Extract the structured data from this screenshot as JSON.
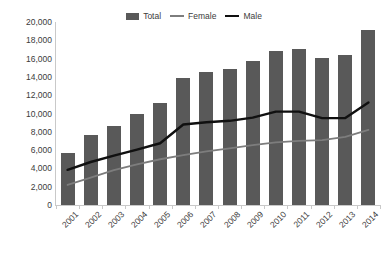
{
  "chart_data": {
    "type": "bar",
    "title": "",
    "subtitle": "",
    "xlabel": "",
    "ylabel": "",
    "grid": false,
    "legend_position": "top-center",
    "categories": [
      "2001",
      "2002",
      "2003",
      "2004",
      "2005",
      "2006",
      "2007",
      "2008",
      "2009",
      "2010",
      "2011",
      "2012",
      "2013",
      "2014"
    ],
    "ylim": [
      0,
      20000
    ],
    "ytick_values": [
      0,
      2000,
      4000,
      6000,
      8000,
      10000,
      12000,
      14000,
      16000,
      18000,
      20000
    ],
    "ytick_labels": [
      "0",
      "2,000",
      "4,000",
      "6,000",
      "8,000",
      "10,000",
      "12,000",
      "14,000",
      "16,000",
      "18,000",
      "20,000"
    ],
    "series": [
      {
        "name": "Total",
        "render": "bar",
        "color": "#595959",
        "values": [
          5700,
          7600,
          8600,
          10000,
          11100,
          13850,
          14500,
          14900,
          15700,
          16800,
          17100,
          16100,
          16350,
          19100
        ]
      },
      {
        "name": "Female",
        "render": "line",
        "color": "#7d7d7d",
        "values": [
          2200,
          3000,
          3800,
          4450,
          5000,
          5450,
          5850,
          6200,
          6550,
          6850,
          7000,
          7100,
          7450,
          8200
        ]
      },
      {
        "name": "Male",
        "render": "line",
        "color": "#101010",
        "values": [
          3850,
          4700,
          5400,
          6050,
          6750,
          8800,
          9050,
          9200,
          9550,
          10200,
          10200,
          9500,
          9500,
          11200
        ]
      }
    ]
  },
  "legend": {
    "items": [
      {
        "label": "Total",
        "marker": "bar-swatch"
      },
      {
        "label": "Female",
        "marker": "line-swatch"
      },
      {
        "label": "Male",
        "marker": "line-swatch"
      }
    ]
  }
}
